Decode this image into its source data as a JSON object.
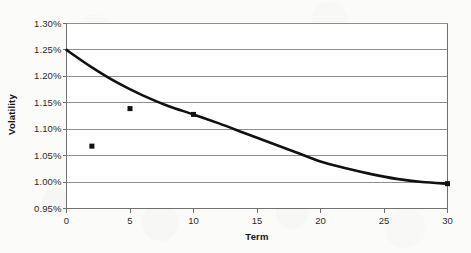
{
  "chart_data": {
    "type": "scatter",
    "title": "",
    "xlabel": "Term",
    "ylabel": "Volatility",
    "xlim": [
      0,
      30
    ],
    "ylim": [
      0.0095,
      0.013
    ],
    "grid": true,
    "legend": "none",
    "x_ticks": [
      0,
      5,
      10,
      15,
      20,
      25,
      30
    ],
    "x_tick_labels": [
      "0",
      "5",
      "10",
      "15",
      "20",
      "25",
      "30"
    ],
    "y_ticks": [
      0.0095,
      0.01,
      0.0105,
      0.011,
      0.0115,
      0.012,
      0.0125,
      0.013
    ],
    "y_tick_labels": [
      "0.95%",
      "1.00%",
      "1.05%",
      "1.10%",
      "1.15%",
      "1.20%",
      "1.25%",
      "1.30%"
    ],
    "series": [
      {
        "name": "Market volatility",
        "type": "scatter",
        "marker": "square",
        "color": "#111111",
        "points": [
          {
            "x": 2,
            "y": 0.01068
          },
          {
            "x": 5,
            "y": 0.01139
          },
          {
            "x": 10,
            "y": 0.01128
          },
          {
            "x": 30,
            "y": 0.00997
          }
        ]
      },
      {
        "name": "Fitted volatility curve",
        "type": "line",
        "color": "#111111",
        "points": [
          {
            "x": 0,
            "y": 0.0125
          },
          {
            "x": 2,
            "y": 0.01217
          },
          {
            "x": 4,
            "y": 0.01188
          },
          {
            "x": 6,
            "y": 0.01164
          },
          {
            "x": 8,
            "y": 0.01144
          },
          {
            "x": 10,
            "y": 0.01128
          },
          {
            "x": 12,
            "y": 0.01111
          },
          {
            "x": 14,
            "y": 0.01093
          },
          {
            "x": 16,
            "y": 0.01075
          },
          {
            "x": 18,
            "y": 0.01057
          },
          {
            "x": 20,
            "y": 0.01039
          },
          {
            "x": 22,
            "y": 0.01026
          },
          {
            "x": 24,
            "y": 0.01015
          },
          {
            "x": 26,
            "y": 0.01006
          },
          {
            "x": 28,
            "y": 0.01
          },
          {
            "x": 30,
            "y": 0.00997
          }
        ]
      }
    ]
  },
  "colors": {
    "plot_background": "#ffffff",
    "page_background": "#fbfbfa",
    "gridline": "#8d8d8d",
    "axis": "#6f6f6f",
    "data": "#111111",
    "text": "#2b2b2b"
  }
}
